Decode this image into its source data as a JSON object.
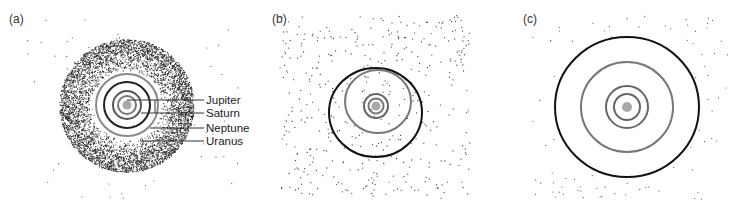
{
  "figure": {
    "panels": [
      {
        "id": "a",
        "label": "(a)"
      },
      {
        "id": "b",
        "label": "(b)"
      },
      {
        "id": "c",
        "label": "(c)"
      }
    ],
    "planet_labels": [
      "Jupiter",
      "Saturn",
      "Neptune",
      "Uranus"
    ],
    "colors": {
      "sun": "#a8a8a8",
      "gray_orbit": "#7a7a7a",
      "dark_orbit": "#2a2a2a",
      "black_orbit": "#111111",
      "particles": "#333333"
    }
  }
}
